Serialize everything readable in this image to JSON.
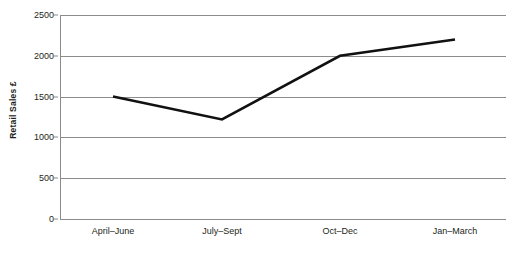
{
  "chart_data": {
    "type": "line",
    "title": "",
    "xlabel": "",
    "ylabel": "Retail Sales £",
    "categories": [
      "April–June",
      "July–Sept",
      "Oct–Dec",
      "Jan–March"
    ],
    "values": [
      1500,
      1220,
      2000,
      2200
    ],
    "series": [
      {
        "name": "Retail Sales",
        "values": [
          1500,
          1220,
          2000,
          2200
        ],
        "color": "#111111"
      }
    ],
    "ylim": [
      0,
      2500
    ],
    "yticks": [
      0,
      500,
      1000,
      1500,
      2000,
      2500
    ],
    "ytick_labels": [
      "0",
      "500",
      "1000",
      "1500",
      "2000",
      "2500"
    ],
    "grid": true,
    "grid_axis": "y",
    "grid_color": "#8b8b8b",
    "legend": false,
    "legend_position": "none",
    "background": "#ffffff",
    "text_color": "#231f20"
  },
  "axes": {
    "y_title": "Retail Sales £"
  }
}
